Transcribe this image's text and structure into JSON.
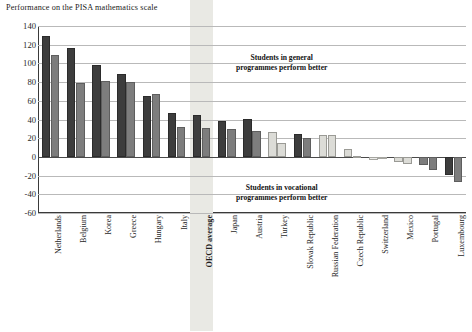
{
  "chart_data": {
    "type": "bar",
    "title": "Performance on the PISA mathematics scale",
    "xlabel": "",
    "ylabel": "",
    "ylim": [
      -60,
      140
    ],
    "yticks": [
      140,
      120,
      100,
      80,
      60,
      40,
      20,
      0,
      -20,
      -40,
      -60
    ],
    "grid": true,
    "legend_position": "none",
    "categories": [
      "Netherlands",
      "Belgium",
      "Korea",
      "Greece",
      "Hungary",
      "Italy",
      "OECD average",
      "Japan",
      "Austria",
      "Turkey",
      "Slovak Republic",
      "Russian Federation",
      "Czech Republic",
      "Switzerland",
      "Mexico",
      "Portugal",
      "Luxembourg"
    ],
    "highlight_category": "OECD average",
    "series": [
      {
        "name": "series-a",
        "values": [
          129,
          116,
          98,
          89,
          65,
          47,
          45,
          38,
          41,
          27,
          25,
          23,
          8,
          -3,
          -5,
          -9,
          -19
        ]
      },
      {
        "name": "series-b",
        "values": [
          109,
          79,
          81,
          80,
          67,
          32,
          31,
          30,
          28,
          15,
          20,
          23,
          1,
          -2,
          -8,
          -14,
          -27
        ]
      }
    ],
    "bar_shades": {
      "dark": "#3d3d3d",
      "mid": "#7d7d7d",
      "light": "#dcdcd7",
      "pale": "#ececea"
    },
    "series_styles": [
      [
        "dark",
        "dark",
        "dark",
        "dark",
        "dark",
        "dark",
        "dark",
        "dark",
        "dark",
        "light",
        "dark",
        "light",
        "light",
        "pale",
        "light",
        "mid",
        "dark"
      ],
      [
        "mid",
        "mid",
        "mid",
        "mid",
        "mid",
        "mid",
        "mid",
        "mid",
        "mid",
        "light",
        "mid",
        "light",
        "light",
        "pale",
        "light",
        "mid",
        "mid"
      ]
    ],
    "annotations": [
      {
        "id": "general",
        "line1": "Students in general",
        "line2": "programmes perform better"
      },
      {
        "id": "vocational",
        "line1": "Students in vocational",
        "line2": "programmes perform better"
      }
    ]
  }
}
